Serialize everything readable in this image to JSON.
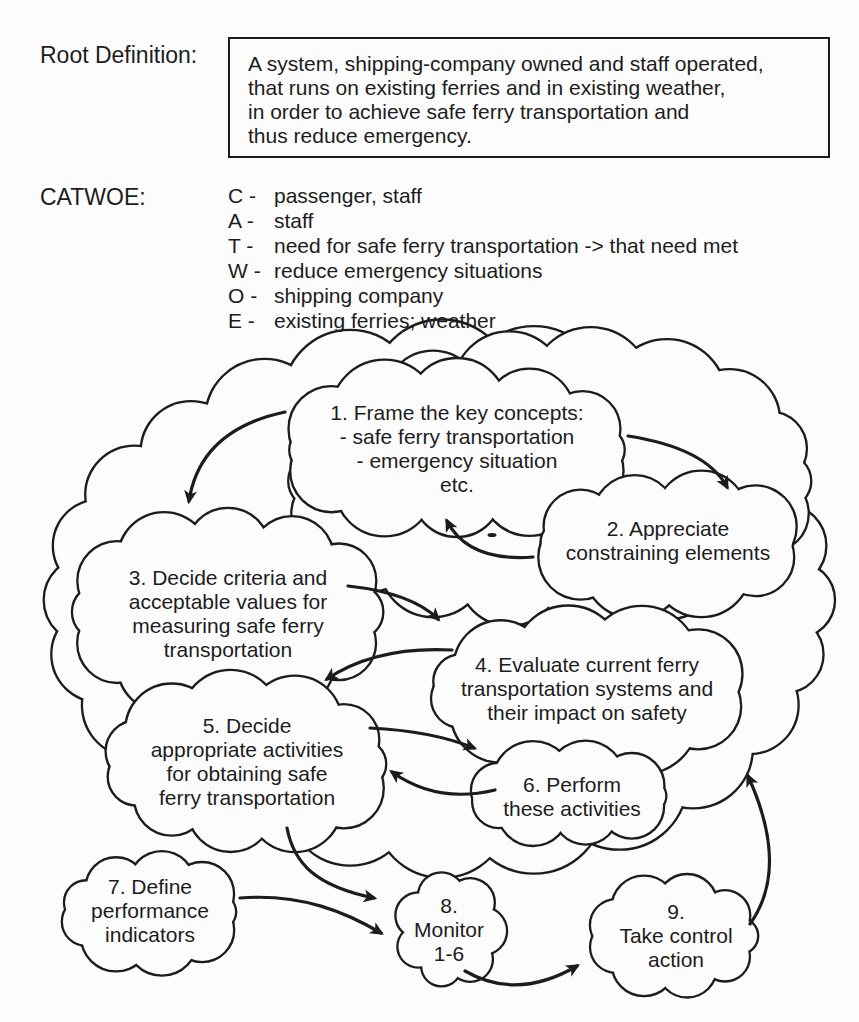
{
  "page": {
    "paper_color": "#fcfcfc",
    "ink_color": "#1c1c1c"
  },
  "root_definition": {
    "label": "Root Definition:",
    "text": "A system, shipping-company owned and staff operated,\nthat runs on existing ferries and in existing weather,\nin order to achieve safe ferry transportation and\nthus reduce emergency."
  },
  "catwoe": {
    "label": "CATWOE:",
    "items": [
      {
        "letter": "C -",
        "text": "passenger, staff"
      },
      {
        "letter": "A -",
        "text": "staff"
      },
      {
        "letter": "T -",
        "text": "need for safe ferry transportation -> that need met"
      },
      {
        "letter": "W -",
        "text": "reduce emergency situations"
      },
      {
        "letter": "O -",
        "text": "shipping company"
      },
      {
        "letter": "E -",
        "text": "existing ferries; weather"
      }
    ]
  },
  "diagram": {
    "clouds": [
      {
        "id": "1",
        "text": "1.  Frame the key concepts:\n- safe ferry transportation\n- emergency situation\netc."
      },
      {
        "id": "2",
        "text": "2.  Appreciate\nconstraining elements"
      },
      {
        "id": "3",
        "text": "3.  Decide criteria and\nacceptable values for\nmeasuring safe ferry\ntransportation"
      },
      {
        "id": "4",
        "text": "4.  Evaluate current ferry\ntransportation systems and\ntheir impact on safety"
      },
      {
        "id": "5",
        "text": "5.  Decide\nappropriate activities\nfor obtaining safe\nferry transportation"
      },
      {
        "id": "6",
        "text": "6. Perform\nthese activities"
      },
      {
        "id": "7",
        "text": "7.  Define\nperformance\nindicators"
      },
      {
        "id": "8",
        "text": "8.\nMonitor\n1-6"
      },
      {
        "id": "9",
        "text": "9.\nTake control\naction"
      }
    ]
  }
}
